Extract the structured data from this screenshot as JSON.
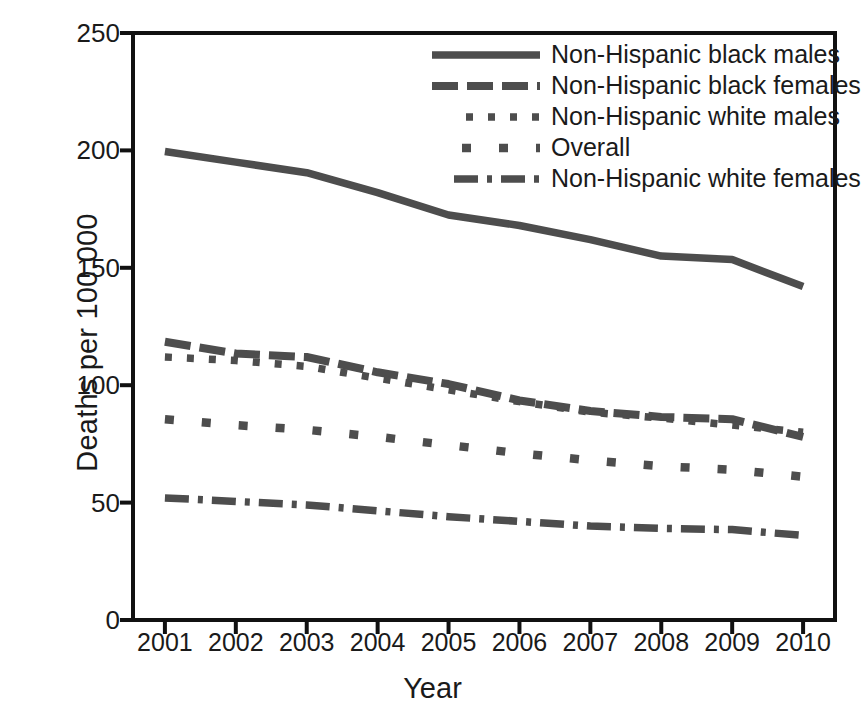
{
  "chart_data": {
    "type": "line",
    "title": "",
    "xlabel": "Year",
    "ylabel": "Deaths per 100,000",
    "x": [
      2001,
      2002,
      2003,
      2004,
      2005,
      2006,
      2007,
      2008,
      2009,
      2010
    ],
    "xtick_labels": [
      "2001",
      "2002",
      "2003",
      "2004",
      "2005",
      "2006",
      "2007",
      "2008",
      "2009",
      "2010"
    ],
    "ytick_labels": [
      "0",
      "50",
      "100",
      "150",
      "200",
      "250"
    ],
    "yticks": [
      0,
      50,
      100,
      150,
      200,
      250
    ],
    "ylim": [
      0,
      250
    ],
    "xlim": [
      2000.55,
      2010.45
    ],
    "grid": false,
    "legend_position": "top-right",
    "line_color": "#4d4d4d",
    "axis_color": "#111111",
    "series": [
      {
        "name": "Non-Hispanic black males",
        "dash": "solid",
        "values": [
          199.5,
          195.0,
          190.5,
          182.0,
          172.5,
          168.0,
          162.0,
          155.0,
          153.5,
          142.0
        ]
      },
      {
        "name": "Non-Hispanic black females",
        "dash": "long-dash",
        "values": [
          118.5,
          113.5,
          112.0,
          105.5,
          100.5,
          93.5,
          89.0,
          86.5,
          85.5,
          78.0
        ]
      },
      {
        "name": "Non-Hispanic white males",
        "dash": "dotted",
        "values": [
          112.0,
          110.5,
          108.0,
          103.0,
          98.0,
          93.0,
          88.5,
          86.0,
          83.0,
          80.0
        ]
      },
      {
        "name": "Overall",
        "dash": "square-dot",
        "values": [
          85.5,
          83.0,
          81.0,
          78.0,
          74.5,
          71.0,
          68.0,
          65.5,
          64.0,
          61.0
        ]
      },
      {
        "name": "Non-Hispanic white females",
        "dash": "dash-dot",
        "values": [
          52.0,
          50.5,
          49.0,
          46.5,
          44.0,
          42.0,
          40.0,
          39.0,
          38.5,
          36.0
        ]
      }
    ]
  },
  "legend": {
    "items": [
      {
        "label": "Non-Hispanic black males",
        "swatch": "solid-line-swatch"
      },
      {
        "label": "Non-Hispanic black females",
        "swatch": "long-dash-line-swatch"
      },
      {
        "label": "Non-Hispanic white males",
        "swatch": "dotted-line-swatch"
      },
      {
        "label": "Overall",
        "swatch": "square-dot-line-swatch"
      },
      {
        "label": "Non-Hispanic white females",
        "swatch": "dash-dot-line-swatch"
      }
    ]
  },
  "bottom_caption": "",
  "colors": {
    "line": "#4d4d4d",
    "axis": "#111111",
    "background": "#ffffff"
  }
}
